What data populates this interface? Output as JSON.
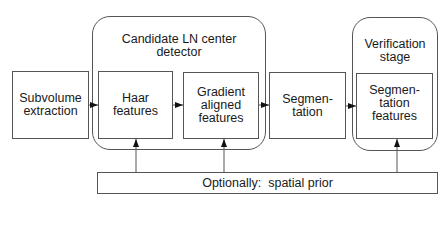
{
  "diagram": {
    "nodes": {
      "subvolume": {
        "label": "Subvolume\nextraction"
      },
      "candidate_group": {
        "title": "Candidate LN center\ndetector"
      },
      "haar": {
        "label": "Haar\nfeatures"
      },
      "gradient": {
        "label": "Gradient\naligned\nfeatures"
      },
      "segmentation": {
        "label": "Segmen-\ntation"
      },
      "verification_group": {
        "title": "Verification\nstage"
      },
      "seg_features": {
        "label": "Segmen-\ntation\nfeatures"
      },
      "spatial_prior": {
        "label": "Optionally:  spatial prior"
      }
    },
    "edges": [
      {
        "from": "subvolume",
        "to": "haar"
      },
      {
        "from": "haar",
        "to": "gradient"
      },
      {
        "from": "gradient",
        "to": "segmentation"
      },
      {
        "from": "segmentation",
        "to": "seg_features"
      },
      {
        "from": "spatial_prior",
        "to": "haar"
      },
      {
        "from": "spatial_prior",
        "to": "gradient"
      },
      {
        "from": "spatial_prior",
        "to": "seg_features"
      }
    ],
    "colors": {
      "stroke": "#555555",
      "text": "#1a1a1a",
      "background": "#ffffff"
    }
  }
}
